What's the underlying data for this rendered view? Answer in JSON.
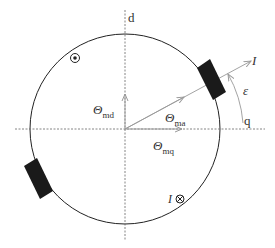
{
  "diagram": {
    "axes": {
      "d_label": "d",
      "q_label": "q"
    },
    "vectors": {
      "theta_md": {
        "symbol": "Θ",
        "subscript": "md"
      },
      "theta_ma": {
        "symbol": "Θ",
        "subscript": "ma"
      },
      "theta_mq": {
        "symbol": "Θ",
        "subscript": "mq"
      },
      "current_axis": "I"
    },
    "angle_label": "ε",
    "current_markers": {
      "out_of_page": "⊙",
      "into_page_label": "I",
      "into_page": "⊗"
    },
    "colors": {
      "circle": "#222222",
      "axis": "#555555",
      "vector": "#999999",
      "pole": "#1a1a1a"
    }
  }
}
